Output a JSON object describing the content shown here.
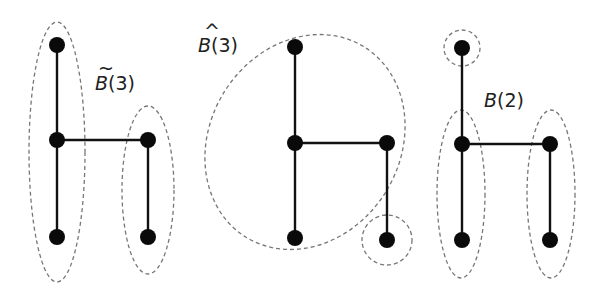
{
  "diagrams": [
    {
      "id": "tilde-b3",
      "label": {
        "accent": "~",
        "letter": "B",
        "arg": "(3)"
      },
      "nodes": [
        "top",
        "mid-left",
        "mid-right",
        "bottom-left",
        "bottom-right"
      ],
      "edges": [
        [
          "top",
          "mid-left"
        ],
        [
          "mid-left",
          "bottom-left"
        ],
        [
          "mid-left",
          "mid-right"
        ],
        [
          "mid-right",
          "bottom-right"
        ]
      ],
      "groups": [
        [
          "top",
          "mid-left",
          "bottom-left"
        ],
        [
          "mid-right",
          "bottom-right"
        ]
      ]
    },
    {
      "id": "hat-b3",
      "label": {
        "accent": "^",
        "letter": "B",
        "arg": "(3)"
      },
      "nodes": [
        "top",
        "mid-left",
        "mid-right",
        "bottom-left",
        "bottom-right"
      ],
      "edges": [
        [
          "top",
          "mid-left"
        ],
        [
          "mid-left",
          "bottom-left"
        ],
        [
          "mid-left",
          "mid-right"
        ],
        [
          "mid-right",
          "bottom-right"
        ]
      ],
      "groups": [
        [
          "top",
          "mid-left",
          "mid-right",
          "bottom-left"
        ],
        [
          "bottom-right"
        ]
      ]
    },
    {
      "id": "b2",
      "label": {
        "accent": "",
        "letter": "B",
        "arg": "(2)"
      },
      "nodes": [
        "top",
        "mid-left",
        "mid-right",
        "bottom-left",
        "bottom-right"
      ],
      "edges": [
        [
          "top",
          "mid-left"
        ],
        [
          "mid-left",
          "bottom-left"
        ],
        [
          "mid-left",
          "mid-right"
        ],
        [
          "mid-right",
          "bottom-right"
        ]
      ],
      "groups": [
        [
          "top"
        ],
        [
          "mid-left",
          "bottom-left"
        ],
        [
          "mid-right",
          "bottom-right"
        ]
      ]
    }
  ]
}
